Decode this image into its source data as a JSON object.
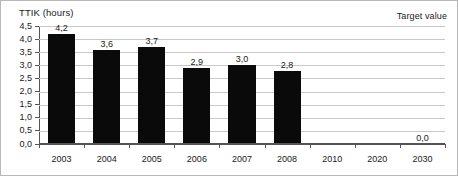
{
  "chart_data": {
    "type": "bar",
    "title": "",
    "xlabel": "",
    "ylabel": "TTIK (hours)",
    "ylim": [
      0.0,
      4.5
    ],
    "grid": true,
    "legend_position": "none",
    "decimal_separator": ",",
    "categories": [
      "2003",
      "2004",
      "2005",
      "2006",
      "2007",
      "2008",
      "2010",
      "2020",
      "2030"
    ],
    "values": [
      4.2,
      3.6,
      3.7,
      2.9,
      3.0,
      2.8,
      null,
      null,
      0.0
    ],
    "data_labels": [
      "4,2",
      "3,6",
      "3,7",
      "2,9",
      "3,0",
      "2,8",
      "",
      "",
      "0,0"
    ],
    "ytick_values": [
      0.0,
      0.5,
      1.0,
      1.5,
      2.0,
      2.5,
      3.0,
      3.5,
      4.0,
      4.5
    ],
    "ytick_labels": [
      "0,0",
      "0,5",
      "1,0",
      "1,5",
      "2,0",
      "2,5",
      "3,0",
      "3,5",
      "4,0",
      "4,5"
    ],
    "annotations": [
      {
        "name": "target-value",
        "text": "Target value",
        "position": "top-right"
      }
    ],
    "series_color": "#0a0a0a",
    "gridline_color": "#c8c8c8",
    "axis_color": "#555555"
  }
}
